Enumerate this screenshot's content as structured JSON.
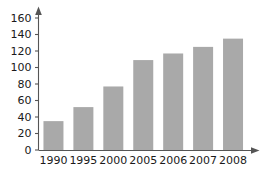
{
  "chart_data": {
    "type": "bar",
    "title": "",
    "subtitle": "",
    "xlabel": "",
    "ylabel": "",
    "categories": [
      "1990",
      "1995",
      "2000",
      "2005",
      "2006",
      "2007",
      "2008"
    ],
    "values": [
      35,
      52,
      77,
      109,
      117,
      125,
      135
    ],
    "series": [
      {
        "name": "",
        "values": [
          35,
          52,
          77,
          109,
          117,
          125,
          135
        ]
      }
    ],
    "ylim": [
      0,
      160
    ],
    "yticks": [
      0,
      20,
      40,
      60,
      80,
      100,
      120,
      140,
      160
    ],
    "ytick_labels": [
      "0",
      "20",
      "40",
      "60",
      "80",
      "100",
      "120",
      "140",
      "160"
    ],
    "xtick_labels": [
      "1990",
      "1995",
      "2000",
      "2005",
      "2006",
      "2007",
      "2008"
    ],
    "grid": false,
    "legend": false,
    "legend_position": "none",
    "annotations": [],
    "colors": {
      "bar_fill": "#a9a9a9",
      "axis": "#555555",
      "text": "#1a1a1a",
      "background": "#ffffff"
    },
    "axis_arrows": {
      "x_axis_arrow": true,
      "y_axis_arrow": true
    }
  }
}
